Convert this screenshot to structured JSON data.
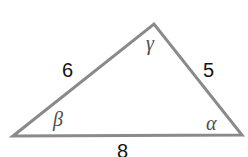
{
  "figure": {
    "type": "triangle-diagram",
    "background_color": "#ffffff",
    "stroke_color": "#8a8a8a",
    "stroke_width": 3,
    "label_color": "#141414",
    "angle_label_color": "#4d4d4d",
    "vertices": {
      "left": {
        "x": 13,
        "y": 136
      },
      "apex": {
        "x": 154,
        "y": 24
      },
      "right": {
        "x": 242,
        "y": 135
      }
    },
    "sides": [
      {
        "name": "left-side",
        "label": "6",
        "from": "left",
        "to": "apex"
      },
      {
        "name": "right-side",
        "label": "5",
        "from": "apex",
        "to": "right"
      },
      {
        "name": "base-side",
        "label": "8",
        "from": "left",
        "to": "right"
      }
    ],
    "angles": [
      {
        "name": "angle-beta",
        "label": "β",
        "vertex": "left"
      },
      {
        "name": "angle-gamma",
        "label": "γ",
        "vertex": "apex"
      },
      {
        "name": "angle-alpha",
        "label": "α",
        "vertex": "right"
      }
    ],
    "polygon_points": "13,136 154,24 242,135"
  }
}
